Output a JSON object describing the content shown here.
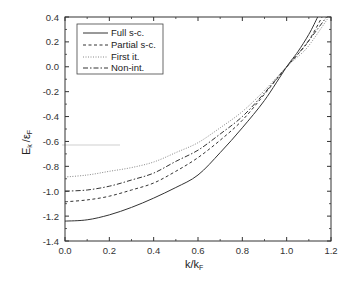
{
  "chart_data": {
    "type": "line",
    "title": "",
    "xlabel": "k/k_F",
    "ylabel": "E_k / ε_F",
    "xlim": [
      0.0,
      1.2
    ],
    "ylim": [
      -1.4,
      0.4
    ],
    "xticks": [
      "0.0",
      "0.2",
      "0.4",
      "0.6",
      "0.8",
      "1.0",
      "1.2"
    ],
    "yticks": [
      "0.4",
      "0.2",
      "0.0",
      "-0.2",
      "-0.4",
      "-0.6",
      "-0.8",
      "-1.0",
      "-1.2",
      "-1.4"
    ],
    "grid": false,
    "legend_position": "upper left",
    "x": [
      0.0,
      0.2,
      0.4,
      0.6,
      0.8,
      1.0,
      1.1,
      1.2
    ],
    "series": [
      {
        "name": "Full s-c.",
        "style": "solid",
        "x": [
          0.0,
          0.1,
          0.2,
          0.3,
          0.4,
          0.5,
          0.6,
          0.7,
          0.8,
          0.9,
          1.0,
          1.05,
          1.1,
          1.14
        ],
        "values": [
          -1.24,
          -1.23,
          -1.19,
          -1.13,
          -1.055,
          -0.97,
          -0.87,
          -0.69,
          -0.49,
          -0.27,
          0.0,
          0.12,
          0.26,
          0.4
        ]
      },
      {
        "name": "Partial s-c.",
        "style": "dashed",
        "x": [
          0.0,
          0.1,
          0.2,
          0.3,
          0.4,
          0.5,
          0.6,
          0.7,
          0.8,
          0.9,
          1.0,
          1.05,
          1.1,
          1.16
        ],
        "values": [
          -1.085,
          -1.07,
          -1.04,
          -0.99,
          -0.934,
          -0.84,
          -0.73,
          -0.59,
          -0.43,
          -0.22,
          0.0,
          0.1,
          0.21,
          0.4
        ]
      },
      {
        "name": "First it.",
        "style": "dotted",
        "x": [
          0.0,
          0.1,
          0.2,
          0.3,
          0.4,
          0.5,
          0.6,
          0.7,
          0.8,
          0.9,
          1.0,
          1.05,
          1.1,
          1.19
        ],
        "values": [
          -0.886,
          -0.87,
          -0.84,
          -0.81,
          -0.765,
          -0.69,
          -0.61,
          -0.49,
          -0.36,
          -0.19,
          0.0,
          0.08,
          0.17,
          0.4
        ]
      },
      {
        "name": "Non-int.",
        "style": "dash-dot",
        "x": [
          0.0,
          0.1,
          0.2,
          0.3,
          0.4,
          0.5,
          0.6,
          0.7,
          0.8,
          0.9,
          1.0,
          1.05,
          1.1,
          1.18
        ],
        "values": [
          -1.0,
          -0.99,
          -0.96,
          -0.91,
          -0.854,
          -0.76,
          -0.67,
          -0.54,
          -0.4,
          -0.21,
          0.0,
          0.1,
          0.21,
          0.4
        ]
      }
    ]
  },
  "legend": {
    "items": [
      {
        "label": "Full s-c."
      },
      {
        "label": "Partial s-c."
      },
      {
        "label": "First it."
      },
      {
        "label": "Non-int."
      }
    ]
  },
  "axes": {
    "xlabel_main": "k/k",
    "xlabel_sub": "F",
    "ylabel_main": "E",
    "ylabel_sub_k": "k",
    "ylabel_rest": "/ε",
    "ylabel_sub_f": "F"
  }
}
